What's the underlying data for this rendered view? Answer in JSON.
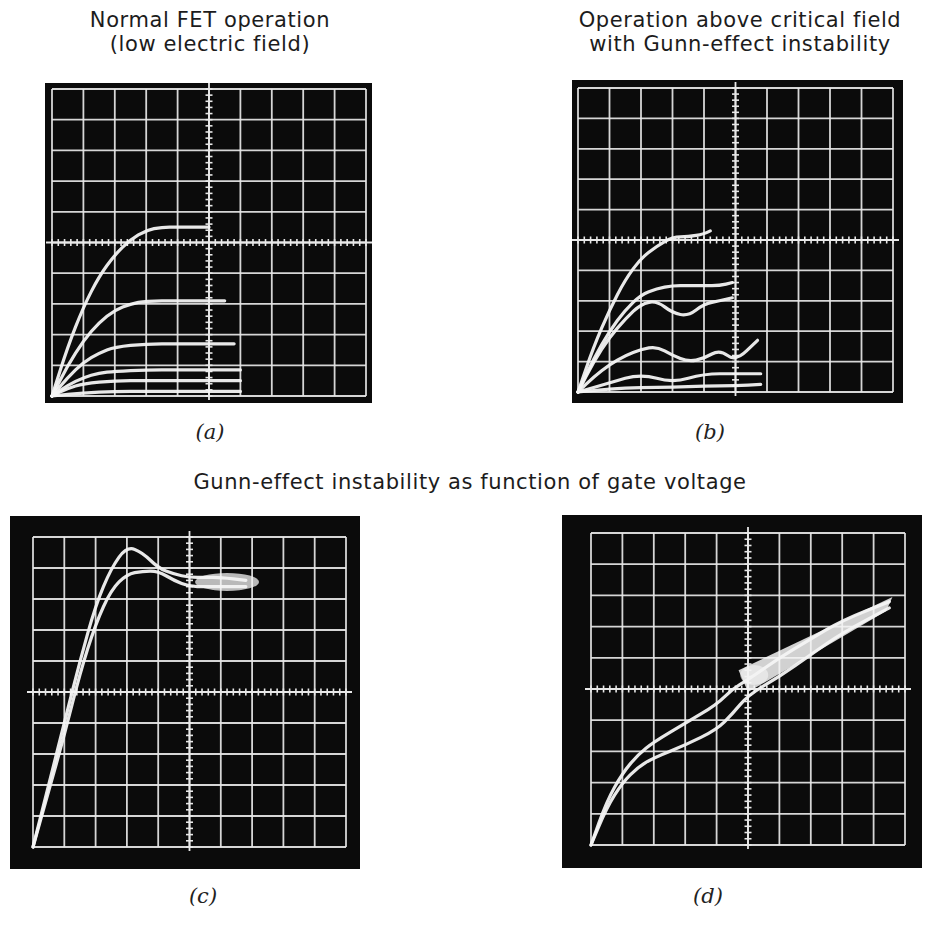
{
  "figure": {
    "titles": {
      "a": "Normal FET operation\n(low electric field)",
      "b": "Operation above critical field\nwith Gunn-effect instability",
      "cd": "Gunn-effect instability as function of gate voltage"
    },
    "panel_labels": {
      "a": "(a)",
      "b": "(b)",
      "c": "(c)",
      "d": "(d)"
    },
    "colors": {
      "screen": "#0b0b0b",
      "graticule": "#e8e8e8",
      "trace": "#f4f4f4",
      "text": "#1c1c1c"
    }
  },
  "chart_data": [
    {
      "id": "a",
      "type": "line",
      "title": "Normal FET operation (low electric field)",
      "xlabel": "",
      "ylabel": "",
      "grid": true,
      "grid_divisions": [
        10,
        10
      ],
      "xlim": [
        0,
        10
      ],
      "ylim": [
        0,
        10
      ],
      "series": [
        {
          "name": "trace-1",
          "x": [
            0,
            0.5,
            1,
            1.5,
            2,
            2.5,
            3,
            3.5,
            4,
            4.5,
            5
          ],
          "y": [
            0,
            1.6,
            2.9,
            3.9,
            4.6,
            5.1,
            5.4,
            5.5,
            5.5,
            5.5,
            5.5
          ]
        },
        {
          "name": "trace-2",
          "x": [
            0,
            0.5,
            1,
            1.5,
            2,
            2.5,
            3,
            4,
            5,
            5.5
          ],
          "y": [
            0,
            1.0,
            1.8,
            2.4,
            2.8,
            3.0,
            3.1,
            3.1,
            3.1,
            3.1
          ]
        },
        {
          "name": "trace-3",
          "x": [
            0,
            0.5,
            1,
            1.5,
            2,
            3,
            4,
            5,
            5.8
          ],
          "y": [
            0,
            0.6,
            1.1,
            1.4,
            1.6,
            1.7,
            1.7,
            1.7,
            1.7
          ]
        },
        {
          "name": "trace-4",
          "x": [
            0,
            0.5,
            1,
            1.5,
            2,
            3,
            4,
            5,
            6
          ],
          "y": [
            0,
            0.35,
            0.6,
            0.75,
            0.8,
            0.85,
            0.85,
            0.85,
            0.85
          ]
        },
        {
          "name": "trace-5",
          "x": [
            0,
            0.5,
            1,
            2,
            3,
            4,
            5,
            6
          ],
          "y": [
            0,
            0.25,
            0.4,
            0.5,
            0.5,
            0.5,
            0.5,
            0.5
          ]
        },
        {
          "name": "trace-6",
          "x": [
            0,
            1,
            2,
            3,
            4,
            5,
            6
          ],
          "y": [
            0,
            0.1,
            0.15,
            0.15,
            0.15,
            0.15,
            0.15
          ]
        }
      ]
    },
    {
      "id": "b",
      "type": "line",
      "title": "Operation above critical field with Gunn-effect instability",
      "xlabel": "",
      "ylabel": "",
      "grid": true,
      "grid_divisions": [
        10,
        10
      ],
      "xlim": [
        0,
        10
      ],
      "ylim": [
        0,
        10
      ],
      "series": [
        {
          "name": "trace-1",
          "x": [
            0,
            0.5,
            1,
            1.5,
            2,
            2.5,
            3,
            3.5,
            4,
            4.2
          ],
          "y": [
            0,
            1.5,
            2.7,
            3.7,
            4.4,
            4.8,
            5.1,
            5.1,
            5.2,
            5.3
          ]
        },
        {
          "name": "trace-2",
          "x": [
            0,
            0.5,
            1,
            1.5,
            2,
            2.5,
            3,
            3.5,
            4,
            4.5,
            4.9
          ],
          "y": [
            0,
            1.1,
            2.0,
            2.7,
            3.2,
            3.4,
            3.5,
            3.5,
            3.5,
            3.5,
            3.6
          ]
        },
        {
          "name": "trace-3",
          "x": [
            0,
            0.5,
            1,
            1.5,
            2,
            2.5,
            3,
            3.5,
            4,
            4.5,
            4.9
          ],
          "y": [
            0,
            1.0,
            1.8,
            2.4,
            2.9,
            3.0,
            2.6,
            2.5,
            2.9,
            3.0,
            3.1
          ]
        },
        {
          "name": "trace-4",
          "x": [
            0,
            0.5,
            1,
            1.5,
            2,
            2.5,
            3,
            3.5,
            4,
            4.5,
            5,
            5.7
          ],
          "y": [
            0,
            0.5,
            0.9,
            1.2,
            1.4,
            1.5,
            1.2,
            1.0,
            1.1,
            1.4,
            1.0,
            1.7
          ]
        },
        {
          "name": "trace-5",
          "x": [
            0,
            1,
            2,
            3,
            4,
            5,
            5.8
          ],
          "y": [
            0,
            0.3,
            0.6,
            0.3,
            0.6,
            0.6,
            0.6
          ]
        },
        {
          "name": "trace-6",
          "x": [
            0,
            1,
            2,
            3,
            4,
            5,
            5.8
          ],
          "y": [
            0,
            0.1,
            0.15,
            0.15,
            0.2,
            0.2,
            0.25
          ]
        }
      ]
    },
    {
      "id": "c",
      "type": "line",
      "title": "Gunn-effect instability as function of gate voltage",
      "xlabel": "",
      "ylabel": "",
      "grid": true,
      "grid_divisions": [
        10,
        10
      ],
      "xlim": [
        0,
        10
      ],
      "ylim": [
        0,
        10
      ],
      "series": [
        {
          "name": "trace-upper",
          "x": [
            0,
            0.5,
            1,
            1.5,
            2,
            2.5,
            3,
            3.5,
            4,
            4.5,
            5,
            5.5,
            6,
            6.8
          ],
          "y": [
            0,
            2.0,
            4.0,
            6.0,
            7.8,
            9.0,
            9.7,
            9.5,
            9.0,
            8.8,
            8.7,
            8.7,
            8.7,
            8.6
          ]
        },
        {
          "name": "trace-lower",
          "x": [
            0,
            0.5,
            1,
            1.5,
            2,
            2.5,
            3,
            3.5,
            4,
            4.5,
            5,
            5.5,
            6,
            6.8
          ],
          "y": [
            0,
            1.8,
            3.6,
            5.6,
            7.2,
            8.3,
            8.8,
            8.9,
            8.9,
            8.6,
            8.4,
            8.4,
            8.4,
            8.4
          ]
        }
      ]
    },
    {
      "id": "d",
      "type": "line",
      "title": "Gunn-effect instability as function of gate voltage",
      "xlabel": "",
      "ylabel": "",
      "grid": true,
      "grid_divisions": [
        10,
        10
      ],
      "xlim": [
        0,
        10
      ],
      "ylim": [
        0,
        10
      ],
      "series": [
        {
          "name": "trace-upper",
          "x": [
            0,
            0.5,
            1,
            1.5,
            2,
            3,
            4,
            4.5,
            5,
            6,
            7,
            8,
            9.5
          ],
          "y": [
            0,
            1.4,
            2.3,
            2.9,
            3.3,
            3.9,
            4.5,
            5.0,
            5.3,
            6.0,
            6.6,
            7.2,
            7.8
          ]
        },
        {
          "name": "trace-lower",
          "x": [
            0,
            0.5,
            1,
            1.5,
            2,
            3,
            4,
            4.5,
            5,
            6,
            7,
            8,
            9.5
          ],
          "y": [
            0,
            1.2,
            2.0,
            2.5,
            2.8,
            3.2,
            3.7,
            4.2,
            4.8,
            5.4,
            6.1,
            6.8,
            7.6
          ]
        }
      ]
    }
  ]
}
